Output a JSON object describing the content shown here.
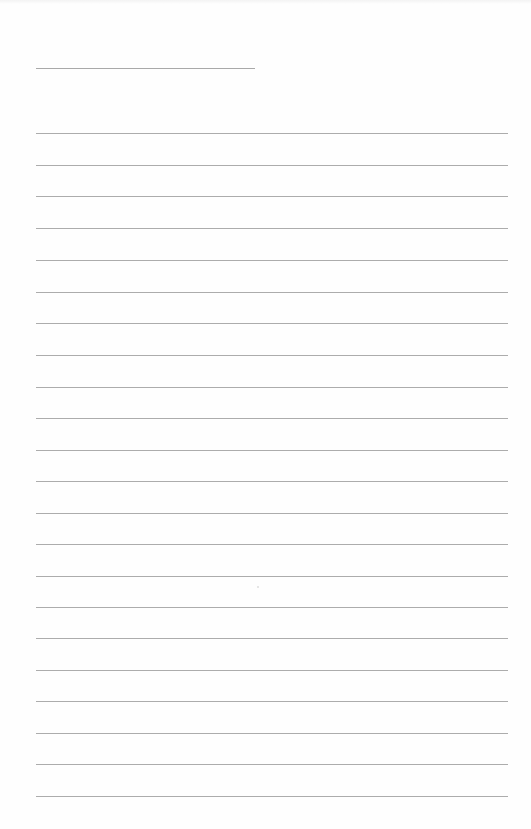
{
  "document": {
    "type": "lined-paper",
    "header_line": {
      "label": "",
      "top": 68,
      "left": 36,
      "width": 219
    },
    "rules": {
      "count": 22,
      "left": 36,
      "width": 472,
      "positions": [
        133,
        165,
        196,
        228,
        260,
        292,
        323,
        355,
        387,
        418,
        450,
        481,
        513,
        544,
        576,
        607,
        638,
        670,
        701,
        733,
        764,
        796
      ]
    },
    "colors": {
      "paper": "#fefefe",
      "rule": "#acacac"
    }
  }
}
